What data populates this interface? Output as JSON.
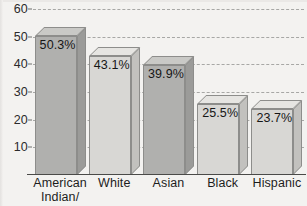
{
  "chart_data": {
    "type": "bar",
    "title": "",
    "xlabel": "",
    "ylabel": "",
    "ylim": [
      0,
      60
    ],
    "grid": true,
    "legend": "none",
    "yticks": [
      60,
      50,
      40,
      30,
      20,
      10
    ],
    "categories": [
      "American Indian/\nAlaska Native",
      "White",
      "Asian",
      "Black",
      "Hispanic"
    ],
    "values": [
      50.3,
      43.1,
      39.9,
      25.5,
      23.7
    ],
    "data_labels": [
      "50.3%",
      "43.1%",
      "39.9%",
      "25.5%",
      "23.7%"
    ],
    "bar_colors": [
      "#b0b0ae",
      "#d8d7d4",
      "#b0b0ae",
      "#d8d7d4",
      "#d8d7d4"
    ],
    "bar_top_colors": [
      "#c9c9c6",
      "#e6e5e2",
      "#c9c9c6",
      "#e6e5e2",
      "#e6e5e2"
    ],
    "bar_side_colors": [
      "#9b9b99",
      "#c2c1be",
      "#9b9b99",
      "#c2c1be",
      "#c2c1be"
    ],
    "style": "3d-bar-grayscale",
    "grid_color": "#9a9a98",
    "axis_color": "#4a4a48",
    "background": "#f3f2f0"
  }
}
